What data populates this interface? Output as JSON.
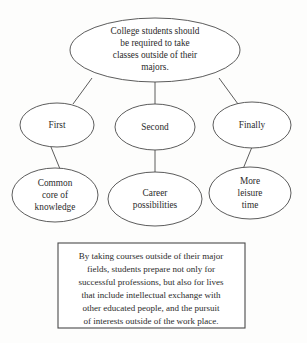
{
  "diagram": {
    "type": "idea-map",
    "root": {
      "name": "thesis-ellipse",
      "lines": [
        "College students should",
        "be required to take",
        "classes outside of their",
        "majors."
      ]
    },
    "steps": [
      {
        "name": "step-first",
        "label": "First"
      },
      {
        "name": "step-second",
        "label": "Second"
      },
      {
        "name": "step-finally",
        "label": "Finally"
      }
    ],
    "details": [
      {
        "name": "detail-common-core",
        "lines": [
          "Common",
          "core of",
          "knowledge"
        ]
      },
      {
        "name": "detail-career",
        "lines": [
          "Career",
          "possibilities"
        ]
      },
      {
        "name": "detail-leisure",
        "lines": [
          "More",
          "leisure",
          "time"
        ]
      }
    ],
    "summary": {
      "name": "summary-box",
      "lines": [
        "By taking courses outside of their major",
        "fields, students prepare not only for",
        "successful professions, but also for lives",
        "that include intellectual exchange with",
        "other educated people, and the pursuit",
        "of interests outside of the work place."
      ]
    },
    "colors": {
      "background": "#fdfdfc",
      "stroke": "#4a4a4a",
      "text": "#2b2b2b",
      "fill": "#ffffff"
    }
  }
}
